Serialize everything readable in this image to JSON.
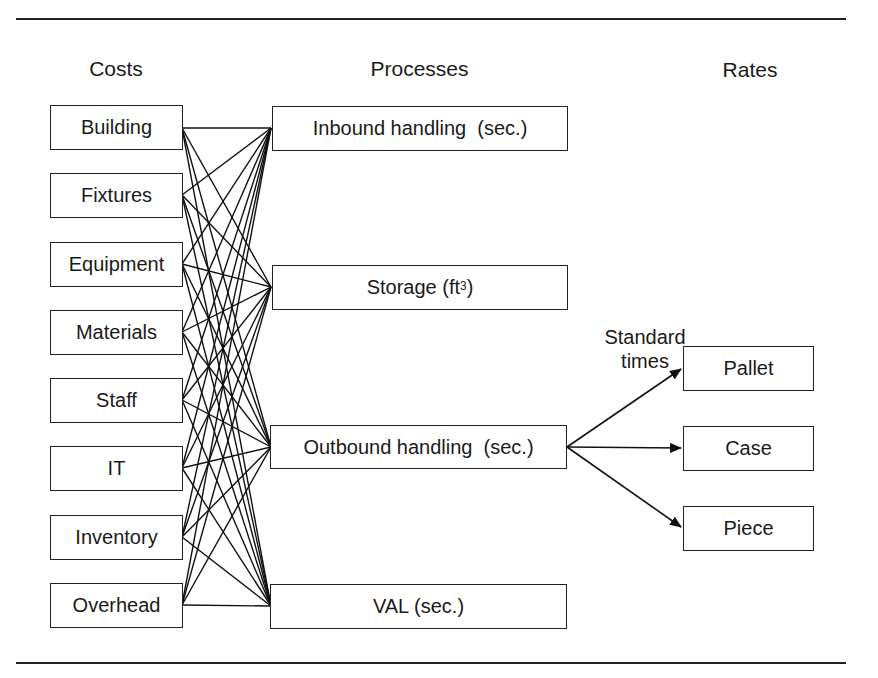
{
  "headers": {
    "costs": "Costs",
    "processes": "Processes",
    "rates": "Rates"
  },
  "costs": [
    "Building",
    "Fixtures",
    "Equipment",
    "Materials",
    "Staff",
    "IT",
    "Inventory",
    "Overhead"
  ],
  "processes": [
    {
      "label": "Inbound handling  (sec.)"
    },
    {
      "label": "Storage (ft",
      "sup": "3",
      "suffix": ")"
    },
    {
      "label": "Outbound handling  (sec.)"
    },
    {
      "label": "VAL (sec.)"
    }
  ],
  "rates": [
    "Pallet",
    "Case",
    "Piece"
  ],
  "annotation": {
    "line1": "Standard",
    "line2": "times"
  },
  "connections": {
    "costs_to_processes": "every cost connects to every process",
    "outbound_to_rates": "Outbound handling arrows to Pallet, Case, Piece"
  }
}
